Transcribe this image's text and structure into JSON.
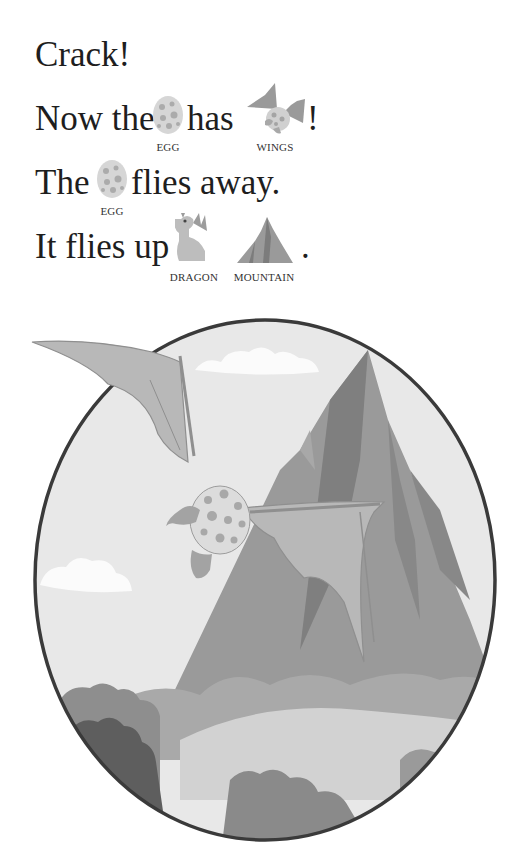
{
  "page": {
    "lines": [
      {
        "text": "Crack!"
      },
      {
        "before": "Now the",
        "middle": "has",
        "end": "!",
        "rebus": [
          {
            "icon": "egg-icon",
            "label": "EGG"
          },
          {
            "icon": "winged-egg-icon",
            "label": "WINGS"
          }
        ]
      },
      {
        "before": "The",
        "after": "flies away.",
        "rebus": [
          {
            "icon": "egg-icon",
            "label": "EGG"
          }
        ]
      },
      {
        "before": "It flies up",
        "end": ".",
        "rebus": [
          {
            "icon": "dragon-icon",
            "label": "DRAGON"
          },
          {
            "icon": "mountain-icon",
            "label": "MOUNTAIN"
          }
        ]
      }
    ]
  },
  "illustration": {
    "description": "Spotted egg with dragon wings flying past a tall mountain inside an oval frame",
    "colors": {
      "frame": "#3a3a3a",
      "sky": "#e6e6e6",
      "mountain": "#8c8c8c",
      "wing": "#b4b4b4",
      "egg": "#dcdcdc",
      "spots": "#a8a8a8",
      "bushes": "#7a7a7a"
    }
  }
}
